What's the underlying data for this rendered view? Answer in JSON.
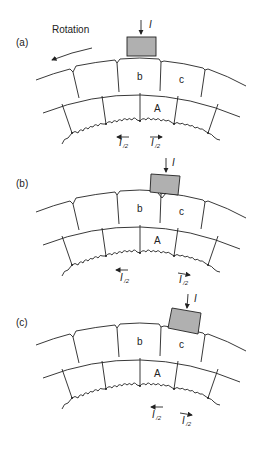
{
  "header": {
    "mark": ""
  },
  "rotation_label": "Rotation",
  "panels": [
    {
      "id": "a",
      "label": "(a)",
      "current_label": "I",
      "segment_labels": {
        "b": "b",
        "c": "c",
        "A": "A"
      },
      "half_current": [
        {
          "symbol": "I",
          "sub": "/2",
          "direction": "left"
        },
        {
          "symbol": "I",
          "sub": "/2",
          "direction": "right"
        }
      ],
      "brush_position": "over segment b"
    },
    {
      "id": "b",
      "label": "(b)",
      "current_label": "I",
      "segment_labels": {
        "b": "b",
        "c": "c",
        "A": "A"
      },
      "half_current": [
        {
          "symbol": "I",
          "sub": "/2",
          "direction": "left"
        },
        {
          "symbol": "I",
          "sub": "/2",
          "direction": "right"
        }
      ],
      "brush_position": "bridging segments b and c"
    },
    {
      "id": "c",
      "label": "(c)",
      "current_label": "I",
      "segment_labels": {
        "b": "b",
        "c": "c",
        "A": "A"
      },
      "half_current": [
        {
          "symbol": "I",
          "sub": "/2",
          "direction": "left"
        },
        {
          "symbol": "I",
          "sub": "/2",
          "direction": "right"
        }
      ],
      "brush_position": "over segment c"
    }
  ],
  "colors": {
    "brush_fill": "#b0b0b0",
    "line": "#222222",
    "background": "#ffffff"
  }
}
